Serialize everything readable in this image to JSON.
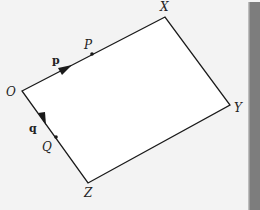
{
  "diagram": {
    "type": "vector-parallelogram",
    "vertices": {
      "O": {
        "label": "O",
        "x": 22,
        "y": 91
      },
      "X": {
        "label": "X",
        "x": 165,
        "y": 17
      },
      "Y": {
        "label": "Y",
        "x": 230,
        "y": 105
      },
      "Z": {
        "label": "Z",
        "x": 88,
        "y": 183
      }
    },
    "points": {
      "P": {
        "label": "P",
        "x": 92,
        "y": 54
      },
      "Q": {
        "label": "Q",
        "x": 56,
        "y": 137
      }
    },
    "vectors": {
      "p": {
        "label": "p",
        "from": "O",
        "along": "OX"
      },
      "q": {
        "label": "q",
        "from": "O",
        "along": "OZ"
      }
    },
    "colors": {
      "line": "#1a1a1a",
      "fill": "#ffffff",
      "background": "#f3f3f3",
      "side_bar": "#7d7d7d"
    }
  }
}
